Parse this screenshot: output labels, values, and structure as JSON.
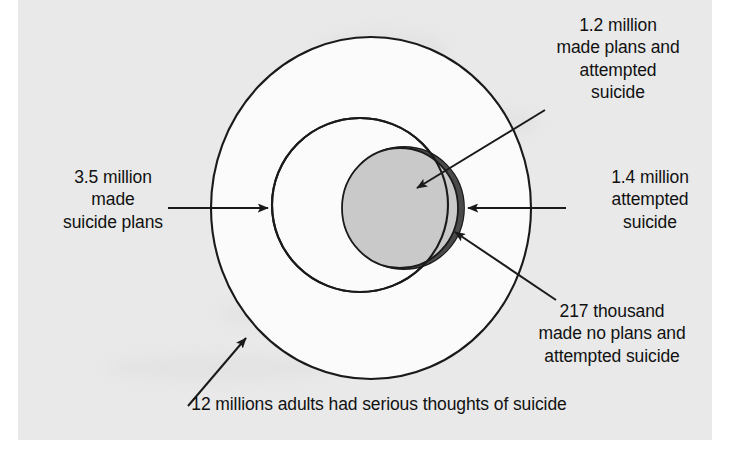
{
  "figure": {
    "type": "nested-proportional-circles",
    "background_color": "#e9e9e9",
    "line_color": "#1a1a1a"
  },
  "labels": {
    "made_plans_and_attempted": "1.2 million\nmade plans and\nattempted\nsuicide",
    "made_suicide_plans": "3.5 million\nmade\nsuicide plans",
    "attempted_suicide": "1.4 million\nattempted\nsuicide",
    "no_plans_and_attempted": "217 thousand\nmade no plans and\nattempted suicide",
    "serious_thoughts_caption": "12 millions adults had serious thoughts of suicide"
  },
  "shapes": {
    "outer_circle": {
      "name": "serious-thoughts-circle",
      "label": "12 millions adults had serious thoughts of suicide",
      "value": 12000000,
      "value_text": "12 millions",
      "fill": "#fbfbfb",
      "stroke": "#1a1a1a",
      "cx": 371,
      "cy": 208,
      "rx": 160,
      "ry": 171
    },
    "middle_circle": {
      "name": "made-plans-circle",
      "label": "3.5 million made suicide plans",
      "value": 3500000,
      "value_text": "3.5 million",
      "fill": "#fbfbfb",
      "stroke": "#1a1a1a",
      "cx": 360,
      "cy": 205,
      "rx": 88,
      "ry": 87
    },
    "light_circle": {
      "name": "plans-and-attempted-circle",
      "label": "1.2 million made plans and attempted suicide",
      "value": 1200000,
      "value_text": "1.2 million",
      "fill": "#c9c9c9",
      "stroke": "#1a1a1a",
      "cx": 400,
      "cy": 208,
      "rx": 58,
      "ry": 60
    },
    "dark_circle": {
      "name": "attempted-suicide-circle",
      "label": "1.4 million attempted suicide",
      "value": 1400000,
      "value_text": "1.4 million",
      "fill": "#4a4a4a",
      "stroke": "#1a1a1a",
      "cx": 404,
      "cy": 208,
      "rx": 60,
      "ry": 61
    },
    "crescent": {
      "name": "no-plans-attempted-crescent",
      "label": "217 thousand made no plans and attempted suicide",
      "value": 217000,
      "value_text": "217 thousand",
      "fill": "#4a4a4a"
    }
  },
  "arrows": [
    {
      "name": "arrow-made-plans",
      "from": "3.5 million made suicide plans",
      "to": "middle-circle"
    },
    {
      "name": "arrow-attempted-suicide",
      "from": "1.4 million attempted suicide",
      "to": "dark-circle"
    },
    {
      "name": "arrow-made-plans-attempted",
      "from": "1.2 million made plans and attempted",
      "to": "light-circle"
    },
    {
      "name": "arrow-no-plans-attempted",
      "from": "217 thousand made no plans and attempted",
      "to": "crescent"
    },
    {
      "name": "arrow-serious-thoughts",
      "from": "12 millions adults had serious thoughts",
      "to": "outer-circle"
    }
  ]
}
